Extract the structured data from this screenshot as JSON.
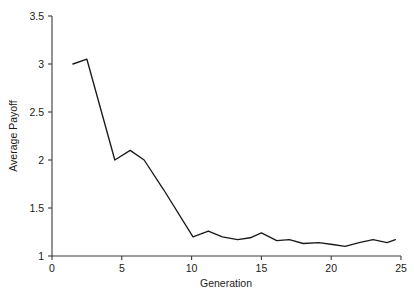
{
  "chart_data": {
    "type": "line",
    "title": "",
    "xlabel": "Generation",
    "ylabel": "Average Payoff",
    "xlim": [
      0,
      25
    ],
    "ylim": [
      1,
      3.5
    ],
    "xticks": [
      0,
      5,
      10,
      15,
      20,
      25
    ],
    "xtick_labels": [
      "0",
      "5",
      "10",
      "15",
      "20",
      "25"
    ],
    "yticks": [
      1,
      1.5,
      2,
      2.5,
      3,
      3.5
    ],
    "ytick_labels": [
      "1",
      "1.5",
      "2",
      "2.5",
      "3",
      "3.5"
    ],
    "grid": false,
    "legend": false,
    "line_color": "#1a1a1a",
    "series": [
      {
        "name": "Average Payoff",
        "x": [
          1.5,
          2.5,
          4.5,
          5.6,
          6.6,
          8.0,
          10.1,
          11.2,
          12.2,
          13.3,
          14.2,
          15.0,
          16.1,
          17.0,
          18.0,
          19.1,
          20.1,
          21.0,
          22.0,
          23.0,
          24.0,
          24.6
        ],
        "y": [
          3.0,
          3.05,
          2.0,
          2.1,
          2.0,
          1.69,
          1.2,
          1.26,
          1.2,
          1.17,
          1.19,
          1.24,
          1.16,
          1.17,
          1.13,
          1.14,
          1.12,
          1.1,
          1.14,
          1.17,
          1.14,
          1.17
        ]
      }
    ]
  },
  "axes": {
    "ylabel": "Average Payoff",
    "xlabel": "Generation"
  }
}
